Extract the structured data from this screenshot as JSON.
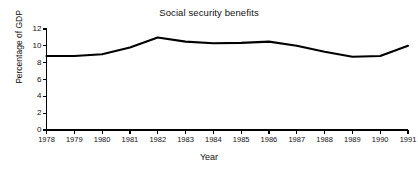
{
  "chart_data": {
    "type": "line",
    "title": "Social security benefits",
    "xlabel": "Year",
    "ylabel": "Percentage of GDP",
    "x": [
      1978,
      1979,
      1980,
      1981,
      1982,
      1983,
      1984,
      1985,
      1986,
      1987,
      1988,
      1989,
      1990,
      1991
    ],
    "values": [
      8.8,
      8.8,
      9.0,
      9.8,
      11.0,
      10.5,
      10.3,
      10.35,
      10.5,
      10.0,
      9.3,
      8.7,
      8.8,
      10.0
    ],
    "xtick_labels": [
      "1978",
      "1979",
      "1980",
      "1981",
      "1982",
      "1983",
      "1984",
      "1985",
      "1986",
      "1987",
      "1988",
      "1989",
      "1990",
      "1991"
    ],
    "ytick_labels": [
      "0",
      "2",
      "4",
      "6",
      "8",
      "10",
      "12"
    ],
    "yticks": [
      0,
      2,
      4,
      6,
      8,
      10,
      12
    ],
    "ylim": [
      0,
      12
    ],
    "xlim": [
      1978,
      1991
    ],
    "grid": false,
    "legend": false,
    "line_color": "#000000",
    "axis_color": "#000000",
    "background_color": "#ffffff"
  }
}
